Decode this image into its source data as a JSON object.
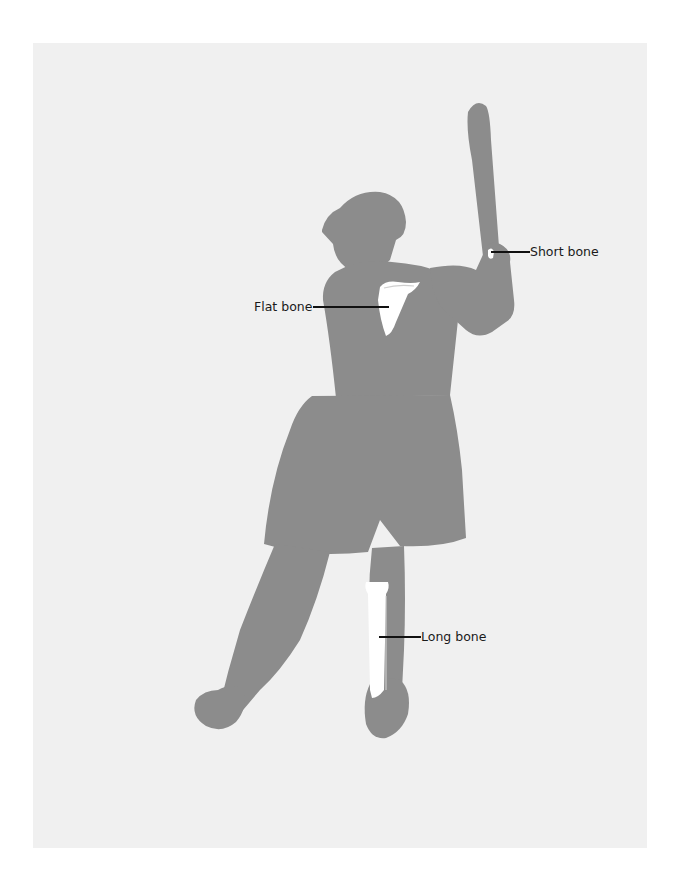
{
  "diagram": {
    "colors": {
      "page_background": "#ffffff",
      "panel_background": "#f0f0f0",
      "body_silhouette": "#8c8c8c",
      "bone": "#ffffff",
      "label_text": "#1a1a1a",
      "leader_line": "#111111"
    },
    "labels": [
      {
        "id": "short-bone",
        "text": "Short bone",
        "target": "hand/wrist bones"
      },
      {
        "id": "flat-bone",
        "text": "Flat bone",
        "target": "shoulder blade (scapula)"
      },
      {
        "id": "long-bone",
        "text": "Long bone",
        "target": "lower leg bones (tibia/fibula)"
      }
    ]
  }
}
